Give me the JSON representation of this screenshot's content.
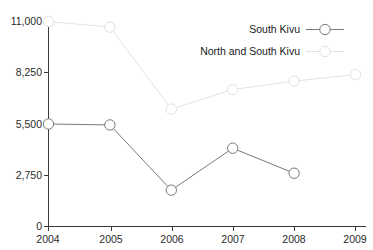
{
  "chart_data": {
    "type": "line",
    "title": "",
    "subtitle": "",
    "xlabel": "",
    "ylabel": "",
    "x": [
      2004,
      2005,
      2006,
      2007,
      2008,
      2009
    ],
    "categories": [
      "2004",
      "2005",
      "2006",
      "2007",
      "2008",
      "2009"
    ],
    "xtick_labels": [
      "2004",
      "2005",
      "2006",
      "2007",
      "2008",
      "2009"
    ],
    "ytick_labels": [
      "0",
      "2,750",
      "5,500",
      "8,250",
      "11,000"
    ],
    "ytick_values": [
      0,
      2750,
      5500,
      8250,
      11000
    ],
    "ylim": [
      0,
      11000
    ],
    "xlim": [
      2004,
      2009
    ],
    "grid": false,
    "legend_position": "top-right",
    "series": [
      {
        "name": "South Kivu",
        "color": "#7a7a7a",
        "marker": "circle-open",
        "line_style": "solid",
        "x": [
          2004,
          2005,
          2006,
          2007,
          2008
        ],
        "values": [
          5500,
          5450,
          1950,
          4200,
          2860
        ]
      },
      {
        "name": "North and South Kivu",
        "color": "#e2e2e2",
        "marker": "circle-open",
        "line_style": "solid",
        "x": [
          2004,
          2005,
          2006,
          2007,
          2008,
          2009
        ],
        "values": [
          11000,
          10700,
          6300,
          7350,
          7800,
          8150
        ]
      }
    ],
    "annotations": []
  },
  "legend": {
    "entries": [
      {
        "label": "South Kivu",
        "color": "#7a7a7a"
      },
      {
        "label": "North and South Kivu",
        "color": "#e2e2e2"
      }
    ]
  },
  "axis": {
    "y_labels": [
      "11,000",
      "8,250",
      "5,500",
      "2,750",
      "0"
    ],
    "x_labels": [
      "2004",
      "2005",
      "2006",
      "2007",
      "2008",
      "2009"
    ]
  }
}
